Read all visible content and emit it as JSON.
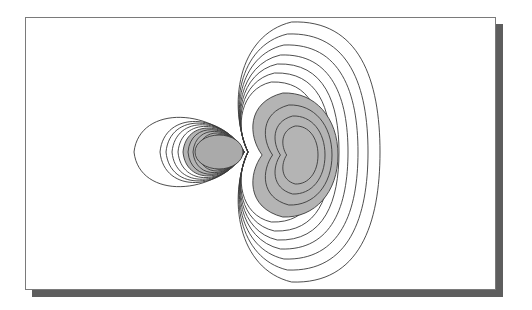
{
  "figure": {
    "frame": {
      "x": 25,
      "y": 17,
      "w": 471,
      "h": 273,
      "border": "#7a7a7a",
      "fill": "#ffffff"
    },
    "shadow": {
      "dx": 7,
      "dy": 7,
      "color": "#5e5e5e"
    },
    "contour_color": "#3a3a3a",
    "shade_color": "#b4b4b4",
    "shade_inner_color": "#aaaaaa"
  },
  "lobes": {
    "small_left": {
      "description": "small lobe (shaded core, negative phase)",
      "tip": [
        244,
        152
      ],
      "contours": [
        {
          "rx": 110,
          "ry": 42
        },
        {
          "rx": 84,
          "ry": 37
        },
        {
          "rx": 78,
          "ry": 35
        },
        {
          "rx": 72,
          "ry": 33
        },
        {
          "rx": 66,
          "ry": 31
        },
        {
          "rx": 61,
          "ry": 29
        },
        {
          "rx": 56,
          "ry": 27
        },
        {
          "rx": 51,
          "ry": 25
        },
        {
          "rx": 46,
          "ry": 23
        },
        {
          "rx": 40,
          "ry": 21
        },
        {
          "rx": 34,
          "ry": 19
        }
      ],
      "shaded_core": {
        "cx": 219,
        "cy": 152,
        "rx": 24,
        "ry": 17
      },
      "shaded_ring_from_index": 5
    },
    "large_right": {
      "description": "large kidney-shaped lobe (shaded core, positive phase)",
      "waist": [
        244,
        152
      ],
      "outer_contours": [
        {
          "rx": 136,
          "ry": 130
        },
        {
          "rx": 124,
          "ry": 118
        },
        {
          "rx": 114,
          "ry": 107
        },
        {
          "rx": 104,
          "ry": 97
        },
        {
          "rx": 95,
          "ry": 88
        },
        {
          "rx": 87,
          "ry": 79
        },
        {
          "rx": 78,
          "ry": 70
        }
      ],
      "shaded_region": {
        "cx": 292,
        "cy": 155,
        "rx": 46,
        "ry": 62
      },
      "inner_contours": [
        {
          "cx": 296,
          "cy": 155,
          "rx": 36,
          "ry": 50
        },
        {
          "cx": 298,
          "cy": 155,
          "rx": 27,
          "ry": 39
        },
        {
          "cx": 299,
          "cy": 155,
          "rx": 19,
          "ry": 29
        }
      ]
    }
  }
}
